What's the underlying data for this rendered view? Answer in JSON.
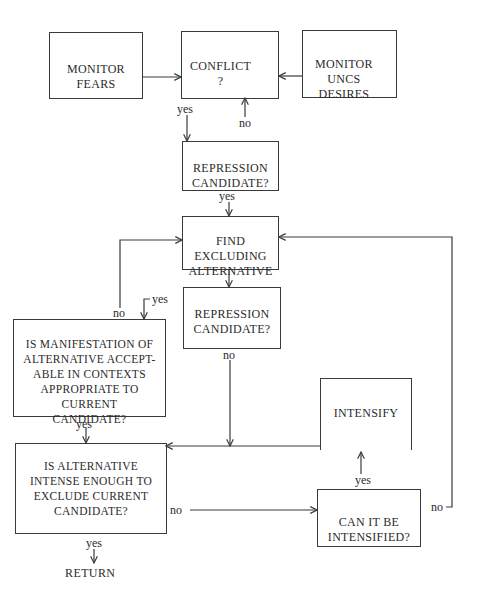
{
  "diagram": {
    "type": "flowchart",
    "stroke_color": "#3a3a3a",
    "text_color": "#2b2b2b",
    "nodes": {
      "monitor_fears": "MONITOR\nFEARS",
      "conflict": "CONFLICT\n?",
      "monitor_uncs_desires": "MONITOR\nUNCS\nDESIRES",
      "repression_candidate_1": "REPRESSION\nCANDIDATE?",
      "find_excluding_alternative": "FIND\nEXCLUDING\nALTERNATIVE",
      "repression_candidate_2": "REPRESSION\nCANDIDATE?",
      "is_manifestation_acceptable": "IS MANIFESTATION OF\nALTERNATIVE ACCEPT-\nABLE IN CONTEXTS\nAPPROPRIATE TO\nCURRENT\nCANDIDATE?",
      "intensify": "INTENSIFY",
      "is_alternative_intense": "IS ALTERNATIVE\nINTENSE ENOUGH TO\nEXCLUDE CURRENT\nCANDIDATE?",
      "can_it_be_intensified": "CAN IT BE\nINTENSIFIED?",
      "return": "RETURN"
    },
    "edge_labels": {
      "conflict_yes": "yes",
      "conflict_no": "no",
      "repression1_yes": "yes",
      "repression2_yes": "yes",
      "repression2_no": "no",
      "manifestation_no": "no",
      "manifestation_yes": "yes",
      "intense_no": "no",
      "intense_yes": "yes",
      "intensified_yes": "yes",
      "intensified_no": "no"
    },
    "edges": [
      {
        "from": "monitor_fears",
        "to": "conflict"
      },
      {
        "from": "monitor_uncs_desires",
        "to": "conflict"
      },
      {
        "from": "conflict",
        "to": "repression_candidate_1",
        "label": "yes"
      },
      {
        "from": "repression_candidate_1",
        "to": "conflict",
        "label": "no"
      },
      {
        "from": "repression_candidate_1",
        "to": "find_excluding_alternative",
        "label": "yes"
      },
      {
        "from": "find_excluding_alternative",
        "to": "repression_candidate_2"
      },
      {
        "from": "repression_candidate_2",
        "to": "is_manifestation_acceptable",
        "label": "yes"
      },
      {
        "from": "repression_candidate_2",
        "to": "is_alternative_intense",
        "label": "no"
      },
      {
        "from": "is_manifestation_acceptable",
        "to": "find_excluding_alternative",
        "label": "no"
      },
      {
        "from": "is_manifestation_acceptable",
        "to": "is_alternative_intense",
        "label": "yes"
      },
      {
        "from": "intensify",
        "to": "is_alternative_intense"
      },
      {
        "from": "is_alternative_intense",
        "to": "can_it_be_intensified",
        "label": "no"
      },
      {
        "from": "is_alternative_intense",
        "to": "return",
        "label": "yes"
      },
      {
        "from": "can_it_be_intensified",
        "to": "intensify",
        "label": "yes"
      },
      {
        "from": "can_it_be_intensified",
        "to": "find_excluding_alternative",
        "label": "no"
      }
    ]
  }
}
